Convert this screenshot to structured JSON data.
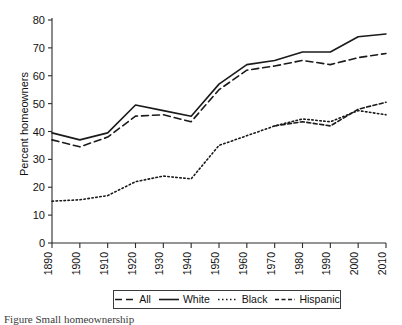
{
  "chart_data": {
    "type": "line",
    "title": "",
    "xlabel": "",
    "ylabel": "Percent homeowners",
    "x": [
      1890,
      1900,
      1910,
      1920,
      1930,
      1940,
      1950,
      1960,
      1970,
      1980,
      1990,
      2000,
      2010
    ],
    "xlim": [
      1890,
      2010
    ],
    "ylim": [
      0,
      80
    ],
    "ytick_labels": [
      "0",
      "10",
      "20",
      "30",
      "40",
      "50",
      "60",
      "70",
      "80"
    ],
    "ytick_values": [
      0,
      10,
      20,
      30,
      40,
      50,
      60,
      70,
      80
    ],
    "xtick_labels": [
      "1890",
      "1900",
      "1910",
      "1920",
      "1930",
      "1940",
      "1950",
      "1960",
      "1970",
      "1980",
      "1990",
      "2000",
      "2010"
    ],
    "grid": false,
    "legend_position": "below-axes",
    "series": [
      {
        "name": "All",
        "style": "dashed",
        "color": "#1a1a1a",
        "dash": "7,4",
        "width": 1.6,
        "values": [
          37.0,
          34.5,
          38.0,
          45.5,
          46.0,
          43.5,
          55.0,
          62.0,
          63.5,
          65.5,
          64.0,
          66.5,
          68.0
        ]
      },
      {
        "name": "White",
        "style": "solid",
        "color": "#1a1a1a",
        "dash": "",
        "width": 1.6,
        "values": [
          39.5,
          37.0,
          39.5,
          49.5,
          47.5,
          45.5,
          57.0,
          64.0,
          65.5,
          68.5,
          68.5,
          74.0,
          75.0
        ]
      },
      {
        "name": "Black",
        "style": "dotted",
        "color": "#1a1a1a",
        "dash": "1.5,2.5",
        "width": 1.6,
        "values": [
          15.0,
          15.5,
          17.0,
          22.0,
          24.0,
          23.0,
          35.0,
          38.5,
          42.0,
          44.5,
          43.5,
          47.5,
          46.0
        ]
      },
      {
        "name": "Hispanic",
        "style": "dash-dot",
        "color": "#1a1a1a",
        "dash": "4,2.5",
        "width": 1.6,
        "start_x": 1970,
        "values": [
          null,
          null,
          null,
          null,
          null,
          null,
          null,
          null,
          42.0,
          43.5,
          42.0,
          48.0,
          50.5
        ]
      }
    ]
  },
  "legend": {
    "items": [
      {
        "label": "All",
        "style": "dashed"
      },
      {
        "label": "White",
        "style": "solid"
      },
      {
        "label": "Black",
        "style": "dotted"
      },
      {
        "label": "Hispanic",
        "style": "dash-dot"
      }
    ]
  },
  "caption": {
    "text": "Figure     Small homeownership"
  }
}
